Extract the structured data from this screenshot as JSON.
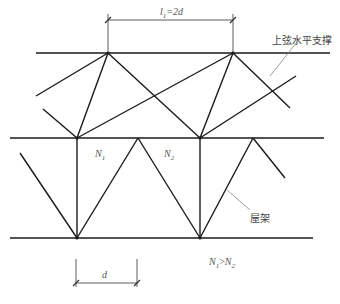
{
  "diagram": {
    "labels": {
      "span_top": "l",
      "span_top_sub": "1",
      "span_top_eq": "=2d",
      "upper_chord_bracing": "上弦水平支撑",
      "n1": "N",
      "n1_sub": "1",
      "n2": "N",
      "n2_sub": "2",
      "truss": "屋架",
      "relation_n1": "N",
      "relation_n1_sub": "1",
      "relation_op": ">",
      "relation_n2": "N",
      "relation_n2_sub": "2",
      "span_bottom": "d"
    },
    "colors": {
      "line": "#1a1a1a",
      "leader": "#888888",
      "text": "#555555"
    }
  }
}
